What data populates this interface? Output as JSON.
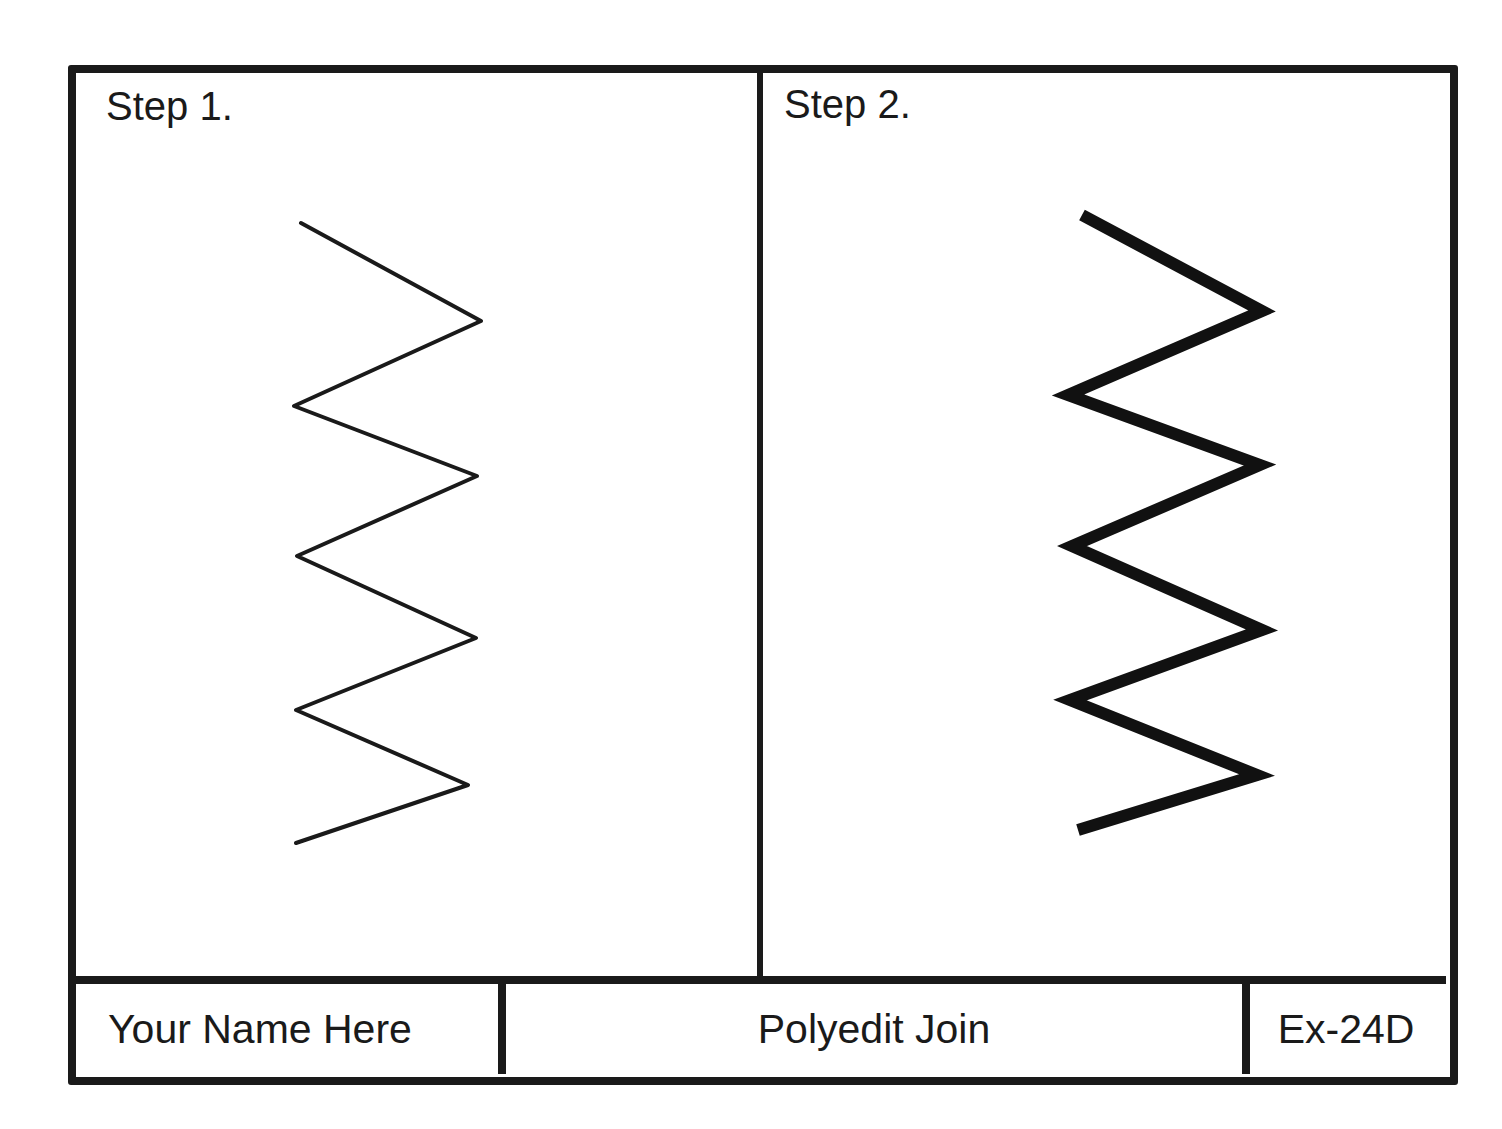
{
  "panels": [
    {
      "label": "Step 1.",
      "polyline_points": "301,223 481,321 294,406 477,476 297,556 476,638 296,710 468,785 296,843",
      "stroke_width": 4,
      "stroke_color": "#1a1a1a"
    },
    {
      "label": "Step 2.",
      "polyline_points": "1082,215 1262,311 1068,395 1260,465 1072,546 1262,630 1070,700 1257,775 1078,830",
      "stroke_width": 12,
      "stroke_color": "#111111"
    }
  ],
  "title_block": {
    "name": "Your Name Here",
    "title": "Polyedit Join",
    "exercise_id": "Ex-24D"
  },
  "colors": {
    "line": "#1a1a1a",
    "background": "#ffffff"
  }
}
